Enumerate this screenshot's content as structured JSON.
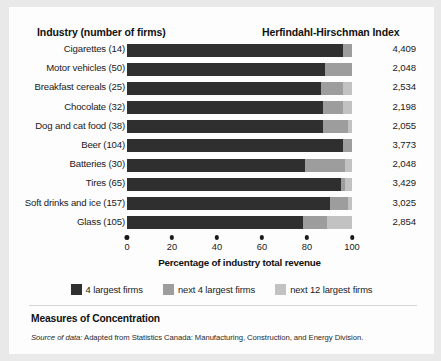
{
  "header": {
    "industry_column": "Industry (number of firms)",
    "hhi_column": "Herfindahl-Hirschman Index"
  },
  "axis": {
    "title": "Percentage of industry total revenue",
    "ticks": [
      "0",
      "20",
      "40",
      "60",
      "80",
      "100"
    ],
    "tick_values": [
      0,
      20,
      40,
      60,
      80,
      100
    ]
  },
  "legend": {
    "items": [
      {
        "label": "4 largest firms",
        "color": "#2f2f2f",
        "icon": "legend-swatch-icon"
      },
      {
        "label": "next 4 largest firms",
        "color": "#9d9d9d",
        "icon": "legend-swatch-icon"
      },
      {
        "label": "next 12 largest firms",
        "color": "#c2c2c2",
        "icon": "legend-swatch-icon"
      }
    ]
  },
  "footer": {
    "title": "Measures of Concentration",
    "source_prefix": "Source of data:",
    "source_text": "Adapted from Statistics Canada: Manufacturing, Construction, and Energy Division."
  },
  "rows": [
    {
      "label": "Cigarettes (14)",
      "hhi": "4,409"
    },
    {
      "label": "Motor vehicles (50)",
      "hhi": "2,048"
    },
    {
      "label": "Breakfast cereals (25)",
      "hhi": "2,534"
    },
    {
      "label": "Chocolate (32)",
      "hhi": "2,198"
    },
    {
      "label": "Dog and cat food (38)",
      "hhi": "2,055"
    },
    {
      "label": "Beer (104)",
      "hhi": "3,773"
    },
    {
      "label": "Batteries (30)",
      "hhi": "2,048"
    },
    {
      "label": "Tires (65)",
      "hhi": "3,429"
    },
    {
      "label": "Soft drinks and ice (157)",
      "hhi": "3,025"
    },
    {
      "label": "Glass (105)",
      "hhi": "2,854"
    }
  ],
  "chart_data": {
    "type": "bar",
    "orientation": "horizontal",
    "stacked": true,
    "title": "Measures of Concentration",
    "xlabel": "Percentage of industry total revenue",
    "ylabel": "Industry (number of firms)",
    "xlim": [
      0,
      100
    ],
    "grid": false,
    "legend_position": "bottom",
    "categories": [
      "Cigarettes (14)",
      "Motor vehicles (50)",
      "Breakfast cereals (25)",
      "Chocolate (32)",
      "Dog and cat food (38)",
      "Beer (104)",
      "Batteries (30)",
      "Tires (65)",
      "Soft drinks and ice (157)",
      "Glass (105)"
    ],
    "series": [
      {
        "name": "4 largest firms",
        "color": "#2f2f2f",
        "values": [
          96,
          88,
          86,
          87,
          87,
          96,
          79,
          95,
          90,
          78
        ]
      },
      {
        "name": "next 4 largest firms",
        "color": "#9d9d9d",
        "values": [
          4,
          12,
          10,
          9,
          11,
          4,
          18,
          2,
          8,
          11
        ]
      },
      {
        "name": "next 12 largest firms",
        "color": "#c2c2c2",
        "values": [
          0,
          0,
          4,
          4,
          2,
          0,
          3,
          3,
          2,
          11
        ]
      }
    ],
    "annotation_series": {
      "name": "Herfindahl-Hirschman Index",
      "values": [
        4409,
        2048,
        2534,
        2198,
        2055,
        3773,
        2048,
        3429,
        3025,
        2854
      ]
    }
  }
}
